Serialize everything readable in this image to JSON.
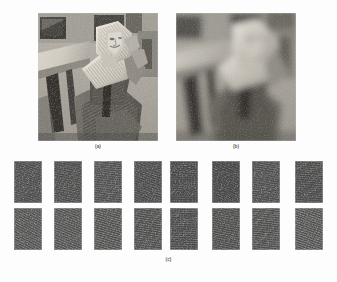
{
  "figure": {
    "kind": "academic-figure",
    "background_color": "#fdfdfd",
    "width": 337,
    "height": 282
  },
  "panels": [
    {
      "id": "a",
      "caption": "(a)",
      "description": "original grayscale Barbara test image",
      "x": 38,
      "y": 13,
      "width": 120,
      "height": 128,
      "tone": {
        "dark": "#2b2b2b",
        "mid": "#8a8a8a",
        "light": "#e6e3dc"
      },
      "blur": 0
    },
    {
      "id": "b",
      "caption": "(b)",
      "description": "blurred low-resolution version of the Barbara test image",
      "x": 176,
      "y": 13,
      "width": 120,
      "height": 128,
      "tone": {
        "dark": "#3a3a3a",
        "mid": "#8f8d88",
        "light": "#ddd9d2"
      },
      "blur": 3.2
    },
    {
      "id": "c",
      "caption": "(c)",
      "description": "grid of extracted dark textured image patches",
      "x": 0,
      "y": 158,
      "width": 337,
      "height": 118
    }
  ],
  "patch_grid": {
    "columns": 8,
    "rows": 2,
    "patch_width": 28,
    "patch_height": 42,
    "row_y": [
      3,
      50
    ],
    "column_x": [
      14,
      54,
      94,
      134,
      170,
      212,
      252,
      295
    ],
    "base_color": "#4a4a4a",
    "patches": [
      {
        "row": 0,
        "col": 0,
        "base": "#4d4d4d",
        "streak_opacity": 0.22,
        "streak_angle": -72,
        "seed": 11
      },
      {
        "row": 0,
        "col": 1,
        "base": "#4b4b4b",
        "streak_opacity": 0.26,
        "streak_angle": -78,
        "seed": 12
      },
      {
        "row": 0,
        "col": 2,
        "base": "#4e4e4e",
        "streak_opacity": 0.3,
        "streak_angle": -84,
        "seed": 13
      },
      {
        "row": 0,
        "col": 3,
        "base": "#4a4a4a",
        "streak_opacity": 0.24,
        "streak_angle": -70,
        "seed": 14
      },
      {
        "row": 0,
        "col": 4,
        "base": "#474747",
        "streak_opacity": 0.2,
        "streak_angle": -88,
        "seed": 15
      },
      {
        "row": 0,
        "col": 5,
        "base": "#464646",
        "streak_opacity": 0.18,
        "streak_angle": -66,
        "seed": 16
      },
      {
        "row": 0,
        "col": 6,
        "base": "#4c4c4c",
        "streak_opacity": 0.28,
        "streak_angle": -80,
        "seed": 17
      },
      {
        "row": 0,
        "col": 7,
        "base": "#494949",
        "streak_opacity": 0.26,
        "streak_angle": -86,
        "seed": 18
      },
      {
        "row": 1,
        "col": 0,
        "base": "#4f4f4f",
        "streak_opacity": 0.38,
        "streak_angle": -62,
        "seed": 21
      },
      {
        "row": 1,
        "col": 1,
        "base": "#4e4e4e",
        "streak_opacity": 0.4,
        "streak_angle": -68,
        "seed": 22
      },
      {
        "row": 1,
        "col": 2,
        "base": "#4d4d4d",
        "streak_opacity": 0.42,
        "streak_angle": -74,
        "seed": 23
      },
      {
        "row": 1,
        "col": 3,
        "base": "#4b4b4b",
        "streak_opacity": 0.34,
        "streak_angle": -82,
        "seed": 24
      },
      {
        "row": 1,
        "col": 4,
        "base": "#484848",
        "streak_opacity": 0.3,
        "streak_angle": -88,
        "seed": 25
      },
      {
        "row": 1,
        "col": 5,
        "base": "#4a4a4a",
        "streak_opacity": 0.32,
        "streak_angle": -78,
        "seed": 26
      },
      {
        "row": 1,
        "col": 6,
        "base": "#4c4c4c",
        "streak_opacity": 0.36,
        "streak_angle": -84,
        "seed": 27
      },
      {
        "row": 1,
        "col": 7,
        "base": "#4e4e4e",
        "streak_opacity": 0.44,
        "streak_angle": -70,
        "seed": 28
      }
    ]
  }
}
